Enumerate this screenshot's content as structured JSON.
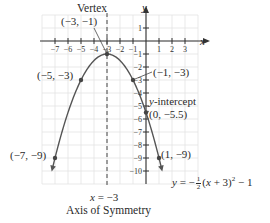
{
  "chart_data": {
    "type": "line",
    "title": "",
    "equation": "y = -1/2 (x + 3)^2 - 1",
    "equation_display": {
      "prefix": "y = −",
      "frac_num": "1",
      "frac_den": "2",
      "middle": "(x + 3)",
      "exponent": "2",
      "suffix": " − 1"
    },
    "xlabel": "x",
    "ylabel": "y",
    "xlim": [
      -8,
      4
    ],
    "ylim": [
      -11,
      2
    ],
    "grid": true,
    "x_ticks": [
      "−7",
      "−6",
      "−5",
      "−4",
      "−3",
      "−2",
      "−1",
      "1",
      "2",
      "3"
    ],
    "x_tick_values": [
      -7,
      -6,
      -5,
      -4,
      -3,
      -2,
      -1,
      1,
      2,
      3
    ],
    "y_ticks": [
      "1",
      "−1",
      "−2",
      "−3",
      "−4",
      "−5",
      "−6",
      "−7",
      "−8",
      "−9",
      "−10"
    ],
    "y_tick_values": [
      1,
      -1,
      -2,
      -3,
      -4,
      -5,
      -6,
      -7,
      -8,
      -9,
      -10
    ],
    "series": [
      {
        "name": "y = −1/2 (x + 3)^2 − 1",
        "x": [
          -7.2,
          -7,
          -6,
          -5,
          -4,
          -3,
          -2,
          -1,
          0,
          1,
          1.2
        ],
        "y": [
          -9.82,
          -9,
          -5.5,
          -3,
          -1.5,
          -1,
          -1.5,
          -3,
          -5.5,
          -9,
          -9.82
        ]
      }
    ],
    "points": [
      {
        "label": "(−3, −1)",
        "x": -3,
        "y": -1,
        "note": "Vertex"
      },
      {
        "label": "(−5, −3)",
        "x": -5,
        "y": -3
      },
      {
        "label": "(−1, −3)",
        "x": -1,
        "y": -3
      },
      {
        "label": "(0, −5.5)",
        "x": 0,
        "y": -5.5,
        "note": "y-intercept"
      },
      {
        "label": "(−7, −9)",
        "x": -7,
        "y": -9
      },
      {
        "label": "(1, −9)",
        "x": 1,
        "y": -9
      }
    ],
    "annotations": {
      "vertex_title": "Vertex",
      "vertex_coords": "(−3, −1)",
      "y_intercept_title": "y-intercept",
      "y_intercept_coords": "(0, −5.5)",
      "axis_of_symmetry_eq": "x = −3",
      "axis_of_symmetry_label": "Axis of Symmetry"
    },
    "legend": "none"
  },
  "labels": {
    "vertex_title": "Vertex",
    "vertex_coords": "(−3, −1)",
    "pt_m5": "(−5, −3)",
    "pt_m1": "(−1, −3)",
    "yint_title": "-intercept",
    "yint_y": "y",
    "yint_coords": "(0, −5.5)",
    "pt_m7": "(−7, −9)",
    "pt_1": "(1, −9)",
    "axis_eq_x": "x",
    "axis_eq_rest": " = −3",
    "axis_label": "Axis of Symmetry",
    "x_axis_label": "x",
    "y_axis_label": "y"
  }
}
